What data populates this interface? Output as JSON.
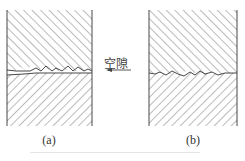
{
  "figure": {
    "panels": [
      {
        "id": "a",
        "label": "(a)",
        "description": "two hatched surfaces in contact with voids at interface"
      },
      {
        "id": "b",
        "label": "(b)",
        "description": "two hatched surfaces in close contact with rough interface"
      }
    ],
    "annotation": {
      "text": "空隙",
      "arrow_direction": "left"
    },
    "colors": {
      "line": "#333333",
      "hatch": "#555555",
      "background": "#ffffff"
    }
  }
}
